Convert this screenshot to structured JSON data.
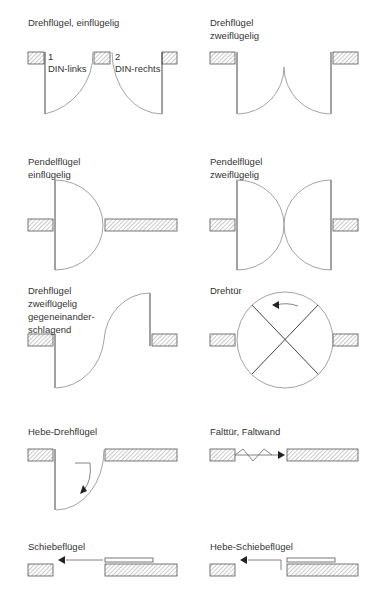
{
  "panels": [
    {
      "id": "drehfluegel-einfluegelig",
      "title": "Drehflügel, einflügelig",
      "sublabels": [
        {
          "num": "1",
          "text": "DIN-links"
        },
        {
          "num": "2",
          "text": "DIN-rechts"
        }
      ]
    },
    {
      "id": "drehfluegel-zweifluegelig",
      "title": "Drehflügel\nzweiflügelig"
    },
    {
      "id": "pendelfluegel-einfluegelig",
      "title": "Pendelflügel\neinflügelig"
    },
    {
      "id": "pendelfluegel-zweifluegelig",
      "title": "Pendelflügel\nzweiflügelig"
    },
    {
      "id": "drehfluegel-gegeneinander",
      "title": "Drehflügel\nzweiflügelig\ngegeneinander-\nschlagend"
    },
    {
      "id": "drehtuer",
      "title": "Drehtür"
    },
    {
      "id": "hebe-drehfluegel",
      "title": "Hebe-Drehflügel"
    },
    {
      "id": "falttuer",
      "title": "Falttür, Faltwand"
    },
    {
      "id": "schiebefluegel",
      "title": "Schiebeflügel"
    },
    {
      "id": "hebe-schiebefluegel",
      "title": "Hebe-Schiebeflügel"
    }
  ],
  "colors": {
    "line": "#444444",
    "arc": "#999999",
    "hatch": "#888888",
    "text": "#333333"
  }
}
